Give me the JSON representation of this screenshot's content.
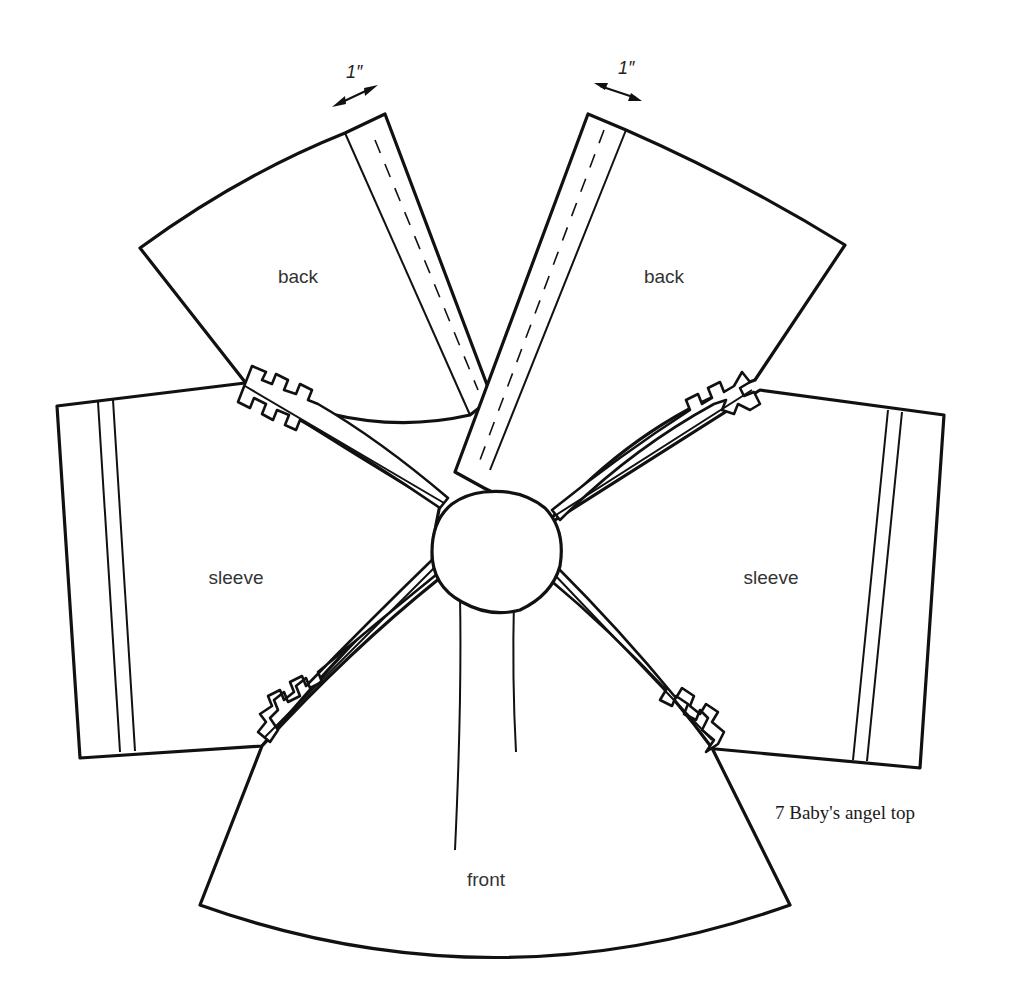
{
  "figure": {
    "caption": "7 Baby's angel top",
    "pieces": {
      "back_left": {
        "label": "back"
      },
      "back_right": {
        "label": "back"
      },
      "sleeve_left": {
        "label": "sleeve"
      },
      "sleeve_right": {
        "label": "sleeve"
      },
      "front": {
        "label": "front"
      }
    },
    "measurements": {
      "left_band_width": "1″",
      "right_band_width": "1″"
    }
  },
  "colors": {
    "line": "#111111",
    "label_text": "#333333",
    "background": "#ffffff"
  }
}
